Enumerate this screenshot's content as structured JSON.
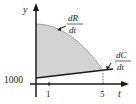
{
  "diagram": {
    "y_axis_label": "y",
    "x_axis_label": "t",
    "y_tick_label": "1000",
    "x_ticks": [
      "1",
      "5"
    ],
    "curve_R": {
      "numerator": "dR",
      "denominator": "dt"
    },
    "curve_C": {
      "numerator": "dC",
      "denominator": "dt"
    },
    "colors": {
      "shade": "#d3d3d3",
      "axis": "#1a1a1a",
      "curve": "#a9a9a9",
      "line": "#1a1a1a"
    }
  }
}
